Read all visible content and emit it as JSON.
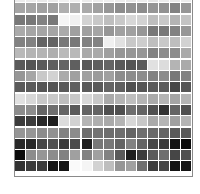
{
  "grid": {
    "columns": 16,
    "rows": 16,
    "colormap": "grayscale (0=black, 255=white)",
    "values": [
      [
        236,
        236,
        232,
        234,
        240,
        238,
        236,
        236,
        238,
        236,
        232,
        236,
        230,
        236,
        232,
        236
      ],
      [
        165,
        165,
        160,
        160,
        175,
        175,
        170,
        160,
        150,
        140,
        145,
        140,
        150,
        145,
        130,
        150
      ],
      [
        120,
        120,
        130,
        120,
        245,
        240,
        210,
        200,
        190,
        200,
        215,
        210,
        190,
        200,
        180,
        195
      ],
      [
        170,
        165,
        165,
        165,
        170,
        160,
        160,
        165,
        150,
        160,
        160,
        150,
        120,
        120,
        130,
        150
      ],
      [
        130,
        130,
        100,
        100,
        120,
        120,
        130,
        130,
        240,
        225,
        200,
        205,
        190,
        200,
        190,
        210
      ],
      [
        185,
        180,
        180,
        175,
        185,
        185,
        170,
        170,
        160,
        150,
        150,
        150,
        130,
        140,
        140,
        170
      ],
      [
        90,
        85,
        90,
        95,
        100,
        95,
        90,
        95,
        100,
        90,
        85,
        90,
        225,
        220,
        180,
        170
      ],
      [
        150,
        165,
        200,
        210,
        170,
        160,
        160,
        155,
        160,
        140,
        140,
        140,
        130,
        140,
        120,
        130
      ],
      [
        90,
        90,
        85,
        85,
        90,
        95,
        90,
        90,
        100,
        95,
        80,
        85,
        90,
        90,
        70,
        85
      ],
      [
        225,
        215,
        200,
        200,
        190,
        200,
        215,
        200,
        170,
        180,
        190,
        180,
        170,
        180,
        165,
        180
      ],
      [
        140,
        140,
        100,
        110,
        100,
        90,
        100,
        100,
        80,
        80,
        110,
        100,
        80,
        50,
        100,
        80
      ],
      [
        60,
        60,
        40,
        30,
        220,
        210,
        180,
        175,
        170,
        180,
        215,
        200,
        170,
        180,
        160,
        180
      ],
      [
        150,
        150,
        140,
        145,
        130,
        140,
        110,
        115,
        110,
        110,
        100,
        110,
        105,
        100,
        90,
        90
      ],
      [
        40,
        40,
        70,
        80,
        60,
        75,
        30,
        120,
        120,
        100,
        130,
        100,
        70,
        60,
        20,
        10
      ],
      [
        10,
        140,
        150,
        140,
        130,
        160,
        130,
        160,
        130,
        90,
        30,
        60,
        90,
        110,
        70,
        80
      ],
      [
        50,
        60,
        60,
        20,
        20,
        250,
        245,
        210,
        190,
        150,
        160,
        110,
        60,
        70,
        20,
        20
      ]
    ]
  },
  "chart_data": {
    "type": "heatmap",
    "title": "",
    "xlabel": "",
    "ylabel": "",
    "grid": false,
    "legend": "none",
    "note": "16x16 grayscale cell grid; top row partially clipped",
    "columns": 16,
    "rows": 16
  }
}
